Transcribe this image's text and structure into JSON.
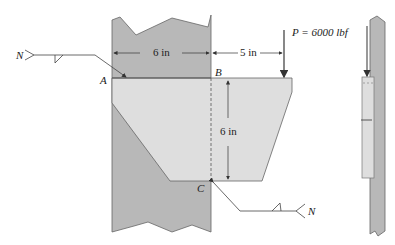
{
  "diagram": {
    "type": "welded bracket on column",
    "labels": {
      "point_a": "A",
      "point_b": "B",
      "point_c": "C",
      "weld_symbol_left": "N",
      "weld_symbol_right": "N"
    },
    "dimensions": {
      "horizontal_weld_length": "6 in",
      "load_offset": "5 in",
      "vertical_weld_length": "6 in"
    },
    "load": {
      "label": "P = 6000 lbf"
    },
    "colors": {
      "column": "#b8b8b8",
      "plate": "#dedede",
      "stroke": "#555555"
    }
  }
}
